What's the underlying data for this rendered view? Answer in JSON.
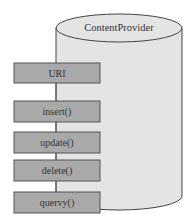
{
  "diagram": {
    "cylinder": {
      "label": "ContentProvider",
      "fill": "#e4e4e4",
      "stroke": "#444444"
    },
    "connector_color": "#555555",
    "box_fill": "#a9a9a9",
    "box_stroke": "#555555",
    "boxes": [
      {
        "label": "URI"
      },
      {
        "label": "insert()"
      },
      {
        "label": "update()"
      },
      {
        "label": "delete()"
      },
      {
        "label": "quervy()"
      }
    ]
  }
}
